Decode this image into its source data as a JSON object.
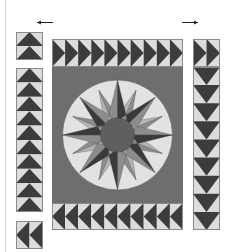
{
  "diagram": {
    "colors": {
      "background": "#ffffff",
      "divider": "#d8d8d8",
      "outline": "#8a8a8a",
      "goose_dark": "#3c3c3c",
      "goose_light": "#dcdcdc",
      "center_field": "#6e6e6e",
      "compass_ring": "#e2e2e2",
      "point_dark": "#3a3a3a",
      "point_mid": "#8c8c8c",
      "point_light": "#b4b4b4",
      "hub": "#5f5f5f",
      "arrow": "#222222"
    },
    "arrows": [
      {
        "name": "left-arrow-icon",
        "direction": "left"
      },
      {
        "name": "right-arrow-icon",
        "direction": "right"
      }
    ],
    "pieces": [
      {
        "name": "left-top-block",
        "geese": 2,
        "direction": "up"
      },
      {
        "name": "left-column-strip",
        "geese": 10,
        "direction": "up"
      },
      {
        "name": "left-bottom-block",
        "geese": 2,
        "direction": "left"
      },
      {
        "name": "top-border-strip",
        "geese": 10,
        "direction": "right"
      },
      {
        "name": "bottom-border-strip",
        "geese": 10,
        "direction": "left"
      },
      {
        "name": "right-column-top",
        "geese": 2,
        "direction": "right"
      },
      {
        "name": "right-column-strip",
        "geese": 9,
        "direction": "down"
      }
    ],
    "compass": {
      "points": 16,
      "major_points": 4,
      "secondary_points": 4,
      "minor_points": 8
    }
  }
}
